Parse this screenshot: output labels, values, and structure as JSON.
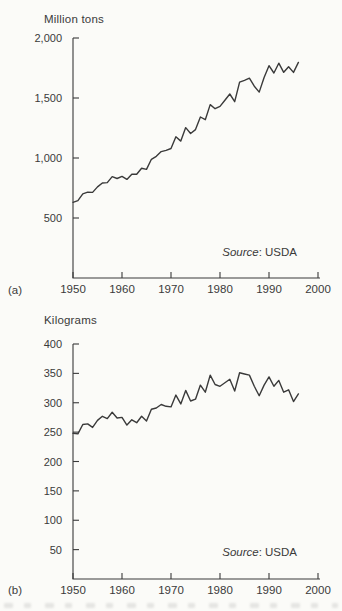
{
  "page": {
    "background": "#fbfbf8",
    "ink_color": "#3a3a3a"
  },
  "chart_data": [
    {
      "type": "line",
      "panel_label": "(a)",
      "unit_label": "Million tons",
      "source_word": "Source",
      "source_rest": ": USDA",
      "title": "",
      "xlabel": "",
      "ylabel": "Million tons",
      "xlim": [
        1950,
        2000
      ],
      "ylim": [
        0,
        2000
      ],
      "grid": false,
      "legend": null,
      "line_color": "#3a3a3a",
      "x_ticks": [
        1950,
        1960,
        1970,
        1980,
        1990,
        2000
      ],
      "x_tick_labels": [
        "1950",
        "1960",
        "1970",
        "1980",
        "1990",
        "2000"
      ],
      "y_ticks": [
        500,
        1000,
        1500,
        2000
      ],
      "y_tick_labels": [
        "500",
        "1,000",
        "1,500",
        "2,000"
      ],
      "x": [
        1950,
        1951,
        1952,
        1953,
        1954,
        1955,
        1956,
        1957,
        1958,
        1959,
        1960,
        1961,
        1962,
        1963,
        1964,
        1965,
        1966,
        1967,
        1968,
        1969,
        1970,
        1971,
        1972,
        1973,
        1974,
        1975,
        1976,
        1977,
        1978,
        1979,
        1980,
        1981,
        1982,
        1983,
        1984,
        1985,
        1986,
        1987,
        1988,
        1989,
        1990,
        1991,
        1992,
        1993,
        1994,
        1995,
        1996
      ],
      "values": [
        631,
        645,
        702,
        716,
        713,
        759,
        792,
        795,
        845,
        829,
        847,
        822,
        864,
        865,
        914,
        905,
        989,
        1014,
        1053,
        1063,
        1079,
        1177,
        1141,
        1253,
        1204,
        1237,
        1342,
        1319,
        1445,
        1411,
        1430,
        1482,
        1533,
        1469,
        1632,
        1647,
        1665,
        1598,
        1549,
        1671,
        1769,
        1708,
        1790,
        1714,
        1761,
        1713,
        1797
      ]
    },
    {
      "type": "line",
      "panel_label": "(b)",
      "unit_label": "Kilograms",
      "source_word": "Source",
      "source_rest": ": USDA",
      "title": "",
      "xlabel": "",
      "ylabel": "Kilograms",
      "xlim": [
        1950,
        2000
      ],
      "ylim": [
        0,
        400
      ],
      "grid": false,
      "legend": null,
      "line_color": "#3a3a3a",
      "x_ticks": [
        1950,
        1960,
        1970,
        1980,
        1990,
        2000
      ],
      "x_tick_labels": [
        "1950",
        "1960",
        "1970",
        "1980",
        "1990",
        "2000"
      ],
      "y_ticks": [
        50,
        100,
        150,
        200,
        250,
        300,
        350,
        400
      ],
      "y_tick_labels": [
        "50",
        "100",
        "150",
        "200",
        "250",
        "300",
        "350",
        "400"
      ],
      "x": [
        1950,
        1951,
        1952,
        1953,
        1954,
        1955,
        1956,
        1957,
        1958,
        1959,
        1960,
        1961,
        1962,
        1963,
        1964,
        1965,
        1966,
        1967,
        1968,
        1969,
        1970,
        1971,
        1972,
        1973,
        1974,
        1975,
        1976,
        1977,
        1978,
        1979,
        1980,
        1981,
        1982,
        1983,
        1984,
        1985,
        1986,
        1987,
        1988,
        1989,
        1990,
        1991,
        1992,
        1993,
        1994,
        1995,
        1996
      ],
      "values": [
        248,
        247,
        263,
        264,
        258,
        270,
        277,
        273,
        284,
        274,
        275,
        262,
        271,
        266,
        277,
        269,
        289,
        291,
        297,
        294,
        293,
        313,
        298,
        321,
        303,
        306,
        330,
        318,
        347,
        331,
        328,
        334,
        340,
        320,
        351,
        349,
        347,
        328,
        312,
        330,
        344,
        328,
        338,
        318,
        322,
        302,
        315
      ]
    }
  ]
}
